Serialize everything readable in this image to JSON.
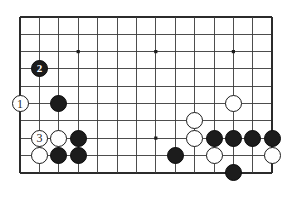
{
  "figure": {
    "name": "go-board-diagram",
    "kind": "go-board",
    "background_color": "#ffffff",
    "board_color": "#ffffff",
    "line_color": "#3a3a3a",
    "border_color": "#2b2b2b",
    "black_color": "#1c1c1c",
    "white_color": "#ffffff"
  },
  "board": {
    "columns": 14,
    "rows": 10,
    "origin_x": 20,
    "origin_y": 17,
    "cell_width": 19.4,
    "cell_height": 17.3,
    "stone_diameter": 17,
    "star_points": [
      {
        "col": 3,
        "row": 2
      },
      {
        "col": 7,
        "row": 2
      },
      {
        "col": 11,
        "row": 2
      },
      {
        "col": 7,
        "row": 7
      }
    ]
  },
  "stones": [
    {
      "id": "w1",
      "color": "white",
      "col": 0,
      "row": 5,
      "label": "1",
      "move_number": 1
    },
    {
      "id": "b2",
      "color": "black",
      "col": 1,
      "row": 3,
      "label": "2",
      "move_number": 2
    },
    {
      "id": "w3",
      "color": "white",
      "col": 1,
      "row": 7,
      "label": "3",
      "move_number": 3
    },
    {
      "id": "b-c2r5",
      "color": "black",
      "col": 2,
      "row": 5,
      "label": ""
    },
    {
      "id": "w-c2r7",
      "color": "white",
      "col": 2,
      "row": 7,
      "label": ""
    },
    {
      "id": "b-c3r7",
      "color": "black",
      "col": 3,
      "row": 7,
      "label": ""
    },
    {
      "id": "w-c1r8",
      "color": "white",
      "col": 1,
      "row": 8,
      "label": ""
    },
    {
      "id": "b-c2r8",
      "color": "black",
      "col": 2,
      "row": 8,
      "label": ""
    },
    {
      "id": "b-c3r8",
      "color": "black",
      "col": 3,
      "row": 8,
      "label": ""
    },
    {
      "id": "b-c8r8",
      "color": "black",
      "col": 8,
      "row": 8,
      "label": ""
    },
    {
      "id": "w-c11r5",
      "color": "white",
      "col": 11,
      "row": 5,
      "label": ""
    },
    {
      "id": "w-c9r6",
      "color": "white",
      "col": 9,
      "row": 6,
      "label": ""
    },
    {
      "id": "w-c9r7",
      "color": "white",
      "col": 9,
      "row": 7,
      "label": ""
    },
    {
      "id": "b-c10r7",
      "color": "black",
      "col": 10,
      "row": 7,
      "label": ""
    },
    {
      "id": "b-c11r7",
      "color": "black",
      "col": 11,
      "row": 7,
      "label": ""
    },
    {
      "id": "b-c12r7",
      "color": "black",
      "col": 12,
      "row": 7,
      "label": ""
    },
    {
      "id": "b-c13r7",
      "color": "black",
      "col": 13,
      "row": 7,
      "label": ""
    },
    {
      "id": "w-c10r8",
      "color": "white",
      "col": 10,
      "row": 8,
      "label": ""
    },
    {
      "id": "w-c13r8",
      "color": "white",
      "col": 13,
      "row": 8,
      "label": ""
    },
    {
      "id": "b-c11r9",
      "color": "black",
      "col": 11,
      "row": 9,
      "label": ""
    }
  ]
}
